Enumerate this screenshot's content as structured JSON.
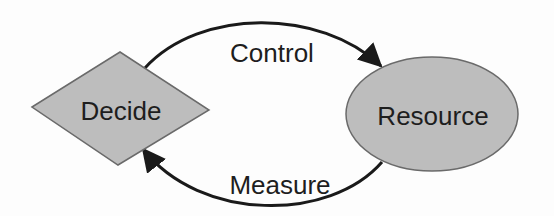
{
  "diagram": {
    "nodes": {
      "decide": {
        "label": "Decide",
        "shape": "diamond"
      },
      "resource": {
        "label": "Resource",
        "shape": "ellipse"
      }
    },
    "edges": {
      "control": {
        "label": "Control",
        "from": "Decide",
        "to": "Resource"
      },
      "measure": {
        "label": "Measure",
        "from": "Resource",
        "to": "Decide"
      }
    },
    "colors": {
      "node_fill": "#bdbdbd",
      "node_stroke": "#6a6a6a",
      "edge": "#1a1a1a",
      "text": "#1e1e1e",
      "background": "#fdfdfd"
    }
  }
}
